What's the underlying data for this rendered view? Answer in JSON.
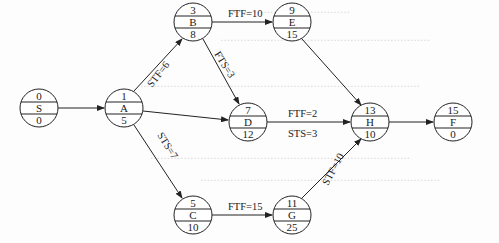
{
  "diagram": {
    "type": "precedence-network",
    "nodes": [
      {
        "id": "S",
        "top": "0",
        "name": "S",
        "bottom": "0",
        "cx": 39,
        "cy": 108
      },
      {
        "id": "A",
        "top": "1",
        "name": "A",
        "bottom": "5",
        "cx": 124,
        "cy": 108
      },
      {
        "id": "B",
        "top": "3",
        "name": "B",
        "bottom": "8",
        "cx": 193,
        "cy": 22
      },
      {
        "id": "C",
        "top": "5",
        "name": "C",
        "bottom": "10",
        "cx": 193,
        "cy": 215
      },
      {
        "id": "D",
        "top": "7",
        "name": "D",
        "bottom": "12",
        "cx": 248,
        "cy": 122
      },
      {
        "id": "E",
        "top": "9",
        "name": "E",
        "bottom": "15",
        "cx": 292,
        "cy": 22
      },
      {
        "id": "G",
        "top": "11",
        "name": "G",
        "bottom": "25",
        "cx": 292,
        "cy": 215
      },
      {
        "id": "H",
        "top": "13",
        "name": "H",
        "bottom": "10",
        "cx": 370,
        "cy": 122
      },
      {
        "id": "F",
        "top": "15",
        "name": "F",
        "bottom": "0",
        "cx": 453,
        "cy": 122
      }
    ],
    "edges": [
      {
        "from": "S",
        "to": "A",
        "label": ""
      },
      {
        "from": "A",
        "to": "B",
        "label": "STF=6"
      },
      {
        "from": "A",
        "to": "D",
        "label": ""
      },
      {
        "from": "A",
        "to": "C",
        "label": "STS=7"
      },
      {
        "from": "B",
        "to": "E",
        "label": "FTF=10"
      },
      {
        "from": "B",
        "to": "D",
        "label": "FTS=3"
      },
      {
        "from": "D",
        "to": "H",
        "label": "FTF=2",
        "label2": "STS=3"
      },
      {
        "from": "E",
        "to": "H",
        "label": ""
      },
      {
        "from": "C",
        "to": "G",
        "label": "FTF=15"
      },
      {
        "from": "G",
        "to": "H",
        "label": "STF=10"
      },
      {
        "from": "H",
        "to": "F",
        "label": ""
      }
    ]
  },
  "labels": {
    "ab": "STF=6",
    "ac": "STS=7",
    "be": "FTF=10",
    "bd": "FTS=3",
    "dh_top": "FTF=2",
    "dh_bottom": "STS=3",
    "cg": "FTF=15",
    "gh": "STF=10"
  },
  "node_text": {
    "S": {
      "top": "0",
      "name": "S",
      "bottom": "0"
    },
    "A": {
      "top": "1",
      "name": "A",
      "bottom": "5"
    },
    "B": {
      "top": "3",
      "name": "B",
      "bottom": "8"
    },
    "C": {
      "top": "5",
      "name": "C",
      "bottom": "10"
    },
    "D": {
      "top": "7",
      "name": "D",
      "bottom": "12"
    },
    "E": {
      "top": "9",
      "name": "E",
      "bottom": "15"
    },
    "G": {
      "top": "11",
      "name": "G",
      "bottom": "25"
    },
    "H": {
      "top": "13",
      "name": "H",
      "bottom": "10"
    },
    "F": {
      "top": "15",
      "name": "F",
      "bottom": "0"
    }
  }
}
